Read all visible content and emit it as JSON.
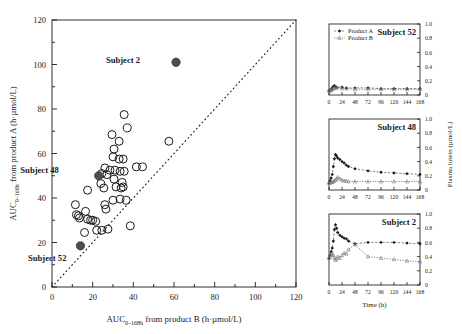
{
  "figure": {
    "background": "#ffffff",
    "ink": "#1a1a1a",
    "marker_open": "#1a1a1a",
    "marker_filled": "#4d4d4d"
  },
  "chart_data": [
    {
      "type": "scatter",
      "name": "auc-scatter",
      "title": "",
      "xlabel": "AUC",
      "xlabel_sub": "0–168h",
      "xlabel_rest": " from product B (h·µmol/L)",
      "ylabel": "AUC",
      "ylabel_sub": "0–168h",
      "ylabel_rest": " from product A (h·µmol/L)",
      "xlim": [
        0,
        120
      ],
      "ylim": [
        0,
        120
      ],
      "xticks": [
        0,
        20,
        40,
        60,
        80,
        100,
        120
      ],
      "yticks": [
        0,
        20,
        40,
        60,
        80,
        100,
        120
      ],
      "minor_tick_step": 10,
      "grid": false,
      "identity_line": {
        "style": "dotted",
        "from": [
          0,
          0
        ],
        "to": [
          120,
          120
        ]
      },
      "points_open": [
        [
          35.5,
          77.5
        ],
        [
          37.0,
          71.5
        ],
        [
          29.5,
          68.5
        ],
        [
          33.0,
          65.5
        ],
        [
          30.5,
          62.0
        ],
        [
          57.5,
          65.5
        ],
        [
          30.0,
          58.5
        ],
        [
          33.0,
          57.5
        ],
        [
          35.0,
          57.5
        ],
        [
          41.5,
          54.0
        ],
        [
          44.5,
          54.0
        ],
        [
          26.0,
          53.5
        ],
        [
          28.5,
          52.5
        ],
        [
          31.0,
          52.5
        ],
        [
          33.5,
          52.0
        ],
        [
          35.5,
          52.0
        ],
        [
          24.5,
          51.0
        ],
        [
          27.0,
          50.5
        ],
        [
          30.5,
          48.5
        ],
        [
          34.5,
          47.0
        ],
        [
          35.0,
          45.0
        ],
        [
          24.0,
          46.5
        ],
        [
          25.5,
          44.5
        ],
        [
          17.5,
          43.5
        ],
        [
          33.5,
          39.5
        ],
        [
          36.5,
          39.0
        ],
        [
          30.0,
          39.0
        ],
        [
          11.5,
          37.0
        ],
        [
          26.0,
          37.0
        ],
        [
          26.5,
          35.0
        ],
        [
          16.5,
          34.0
        ],
        [
          12.0,
          32.5
        ],
        [
          13.5,
          31.0
        ],
        [
          17.5,
          30.5
        ],
        [
          20.0,
          30.0
        ],
        [
          21.5,
          29.5
        ],
        [
          38.5,
          27.5
        ],
        [
          16.0,
          24.5
        ],
        [
          22.0,
          25.5
        ],
        [
          24.5,
          25.5
        ],
        [
          27.5,
          26.0
        ],
        [
          34.0,
          44.5
        ],
        [
          31.5,
          45.0
        ],
        [
          13.0,
          32.0
        ],
        [
          19.0,
          30.0
        ]
      ],
      "points_filled": [
        {
          "label": "Subject 2",
          "x": 61.0,
          "y": 101.0,
          "label_dx": -36,
          "label_dy": 1
        },
        {
          "label": "Subject 48",
          "x": 23.0,
          "y": 50.0,
          "label_dx": -40,
          "label_dy": -3
        },
        {
          "label": "Subject 52",
          "x": 14.0,
          "y": 18.5,
          "label_dx": -14,
          "label_dy": 15
        }
      ]
    },
    {
      "type": "line",
      "name": "panel-subject-52",
      "panel_title": "Subject 52",
      "xlabel": "",
      "ylabel": "",
      "xlim": [
        0,
        168
      ],
      "ylim": [
        0,
        1.0
      ],
      "xticks": [
        0,
        24,
        48,
        72,
        96,
        120,
        144,
        168
      ],
      "yticks": [
        0,
        0.2,
        0.4,
        0.6,
        0.8,
        1.0
      ],
      "legend": [
        "Product A",
        "Product B"
      ],
      "legend_position": "top-left",
      "series": [
        {
          "name": "Product A",
          "marker": "filled-diamond",
          "x": [
            0,
            2,
            4,
            6,
            8,
            10,
            12,
            14,
            24,
            32,
            48,
            72,
            96,
            120,
            144,
            168
          ],
          "values": [
            0.06,
            0.07,
            0.08,
            0.1,
            0.12,
            0.13,
            0.12,
            0.11,
            0.11,
            0.1,
            0.1,
            0.1,
            0.09,
            0.09,
            0.09,
            0.09
          ]
        },
        {
          "name": "Product B",
          "marker": "open-triangle",
          "x": [
            0,
            2,
            4,
            6,
            8,
            10,
            12,
            14,
            24,
            32,
            48,
            72,
            96,
            120,
            144,
            168
          ],
          "values": [
            0.06,
            0.06,
            0.07,
            0.08,
            0.09,
            0.1,
            0.11,
            0.1,
            0.09,
            0.09,
            0.08,
            0.08,
            0.08,
            0.08,
            0.08,
            0.08
          ]
        }
      ]
    },
    {
      "type": "line",
      "name": "panel-subject-48",
      "panel_title": "Subject 48",
      "xlabel": "",
      "ylabel": "Plasma lutein (µmol/L)",
      "xlim": [
        0,
        168
      ],
      "ylim": [
        0,
        1.0
      ],
      "xticks": [
        0,
        24,
        48,
        72,
        96,
        120,
        144,
        168
      ],
      "yticks": [
        0,
        0.2,
        0.4,
        0.6,
        0.8,
        1.0
      ],
      "series": [
        {
          "name": "Product A",
          "marker": "filled-diamond",
          "x": [
            0,
            2,
            4,
            6,
            8,
            10,
            12,
            14,
            16,
            20,
            24,
            28,
            32,
            36,
            48,
            72,
            96,
            120,
            144,
            168
          ],
          "values": [
            0.1,
            0.13,
            0.17,
            0.22,
            0.33,
            0.44,
            0.5,
            0.48,
            0.45,
            0.43,
            0.4,
            0.38,
            0.35,
            0.33,
            0.3,
            0.27,
            0.25,
            0.24,
            0.23,
            0.22
          ]
        },
        {
          "name": "Product B",
          "marker": "open-triangle",
          "x": [
            0,
            2,
            4,
            6,
            8,
            10,
            12,
            14,
            16,
            20,
            24,
            28,
            32,
            36,
            48,
            72,
            96,
            120,
            144,
            168
          ],
          "values": [
            0.1,
            0.1,
            0.11,
            0.11,
            0.12,
            0.13,
            0.14,
            0.16,
            0.18,
            0.16,
            0.14,
            0.13,
            0.13,
            0.12,
            0.12,
            0.12,
            0.12,
            0.12,
            0.12,
            0.12
          ]
        }
      ]
    },
    {
      "type": "line",
      "name": "panel-subject-2",
      "panel_title": "Subject 2",
      "xlabel": "Time (h)",
      "ylabel": "",
      "xlim": [
        0,
        168
      ],
      "ylim": [
        0,
        1.0
      ],
      "xticks": [
        0,
        24,
        48,
        72,
        96,
        120,
        144,
        168
      ],
      "yticks": [
        0,
        0.2,
        0.4,
        0.6,
        0.8,
        1.0
      ],
      "series": [
        {
          "name": "Product A",
          "marker": "filled-diamond",
          "x": [
            0,
            2,
            4,
            6,
            8,
            10,
            12,
            14,
            16,
            20,
            24,
            28,
            32,
            36,
            48,
            72,
            96,
            120,
            144,
            168
          ],
          "values": [
            0.38,
            0.42,
            0.47,
            0.52,
            0.62,
            0.78,
            0.85,
            0.8,
            0.74,
            0.7,
            0.68,
            0.66,
            0.65,
            0.62,
            0.58,
            0.6,
            0.6,
            0.6,
            0.59,
            0.58
          ]
        },
        {
          "name": "Product B",
          "marker": "open-triangle",
          "x": [
            0,
            2,
            4,
            6,
            8,
            10,
            12,
            14,
            16,
            20,
            24,
            28,
            32,
            36,
            48,
            72,
            96,
            120,
            144,
            168
          ],
          "values": [
            0.38,
            0.4,
            0.43,
            0.44,
            0.42,
            0.38,
            0.35,
            0.37,
            0.4,
            0.38,
            0.42,
            0.45,
            0.44,
            0.5,
            0.57,
            0.4,
            0.38,
            0.36,
            0.34,
            0.33
          ]
        }
      ]
    }
  ]
}
